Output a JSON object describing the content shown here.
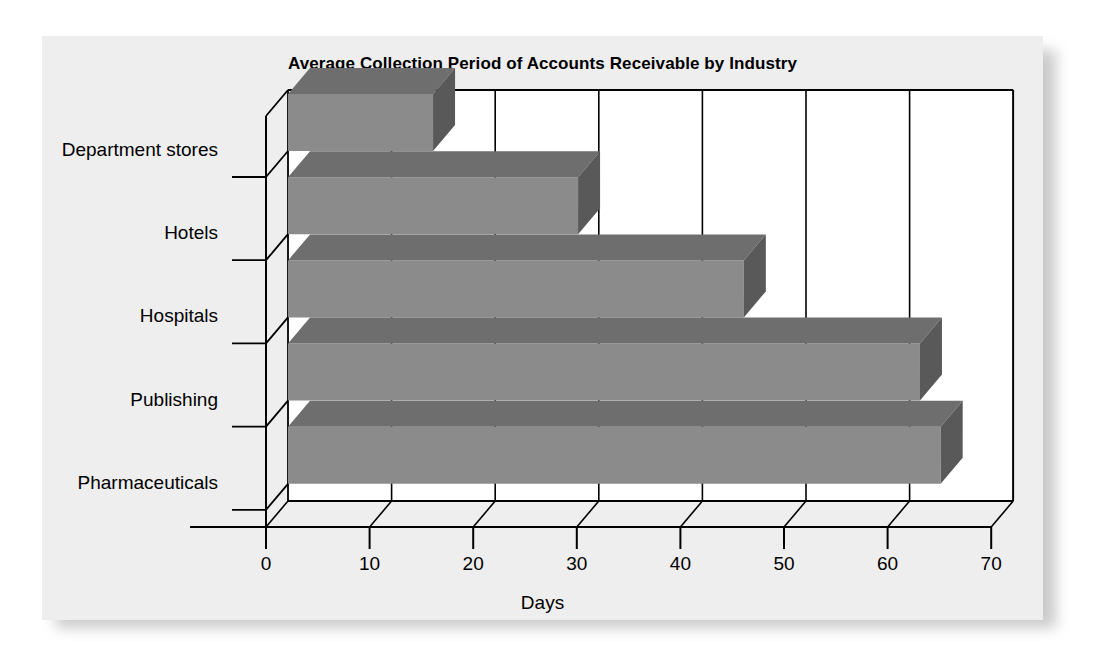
{
  "page": {
    "background_color": "#ffffff",
    "panel_background_color": "#eeeeee"
  },
  "chart_data": {
    "type": "bar",
    "orientation": "horizontal",
    "style": "3d-extruded",
    "title": "Average Collection Period of Accounts Receivable by Industry",
    "xlabel": "Days",
    "ylabel": "",
    "categories": [
      "Department stores",
      "Hotels",
      "Hospitals",
      "Publishing",
      "Pharmaceuticals"
    ],
    "values": [
      14,
      28,
      44,
      61,
      63
    ],
    "xlim": [
      0,
      70
    ],
    "xticks": [
      0,
      10,
      20,
      30,
      40,
      50,
      60,
      70
    ],
    "xtick_labels": [
      "0",
      "10",
      "20",
      "30",
      "40",
      "50",
      "60",
      "70"
    ],
    "grid": "vertical-only",
    "legend": "none",
    "bar_colors": {
      "front": "#8b8b8b",
      "top": "#6e6e6e",
      "side": "#595959"
    },
    "axis_color": "#000000",
    "back_wall_color": "#ffffff"
  }
}
